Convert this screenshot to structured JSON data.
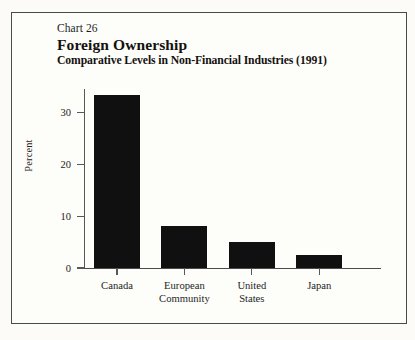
{
  "document": {
    "paper_color": "#fcfbf8",
    "frame_color": "#4a4a4a"
  },
  "titles": {
    "chart_number": "Chart 26",
    "title": "Foreign Ownership",
    "subtitle": "Comparative Levels in Non-Financial Industries (1991)"
  },
  "chart_data": {
    "type": "bar",
    "title": "Foreign Ownership",
    "subtitle": "Comparative Levels in Non-Financial Industries (1991)",
    "chart_number": "Chart 26",
    "categories": [
      "Canada",
      "European Community",
      "United States",
      "Japan"
    ],
    "category_lines": [
      [
        "Canada"
      ],
      [
        "European",
        "Community"
      ],
      [
        "United",
        "States"
      ],
      [
        "Japan"
      ]
    ],
    "values": [
      33.3,
      8.0,
      5.0,
      2.5
    ],
    "xlabel": "",
    "ylabel": "Percent",
    "ylim": [
      0,
      34.5
    ],
    "yticks": [
      0,
      10,
      20,
      30
    ],
    "ytick_labels": [
      "0",
      "10",
      "20",
      "30"
    ],
    "grid": false,
    "legend": false,
    "bar_color": "#111010",
    "axis_color": "#58585a"
  }
}
